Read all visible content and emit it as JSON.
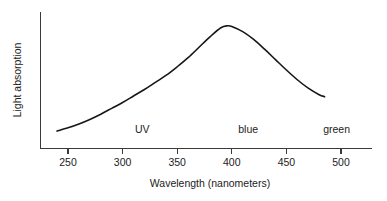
{
  "chart_data": {
    "type": "line",
    "title": "",
    "xlabel": "Wavelength (nanometers)",
    "ylabel": "Light absorption",
    "xlim": [
      238,
      516
    ],
    "ylim": [
      0,
      1
    ],
    "grid": false,
    "legend": "none",
    "xticks": [
      250,
      300,
      350,
      400,
      450,
      500
    ],
    "xtick_labels": [
      "250",
      "300",
      "350",
      "400",
      "450",
      "500"
    ],
    "yticks": [],
    "ytick_labels": [],
    "series": [
      {
        "name": "Light absorption",
        "color": "#171717",
        "x": [
          240,
          250,
          260,
          270,
          280,
          290,
          300,
          310,
          320,
          330,
          340,
          350,
          360,
          370,
          380,
          390,
          396,
          400,
          410,
          420,
          430,
          440,
          450,
          460,
          470,
          480,
          485
        ],
        "y": [
          0.13,
          0.155,
          0.185,
          0.22,
          0.26,
          0.305,
          0.35,
          0.4,
          0.45,
          0.505,
          0.56,
          0.625,
          0.695,
          0.775,
          0.855,
          0.925,
          0.94,
          0.935,
          0.895,
          0.835,
          0.76,
          0.68,
          0.6,
          0.525,
          0.46,
          0.41,
          0.395
        ]
      }
    ],
    "annotations": [
      {
        "text": "UV",
        "x": 318,
        "y": 0.135
      },
      {
        "text": "blue",
        "x": 415,
        "y": 0.135
      },
      {
        "text": "green",
        "x": 496,
        "y": 0.135
      }
    ]
  }
}
